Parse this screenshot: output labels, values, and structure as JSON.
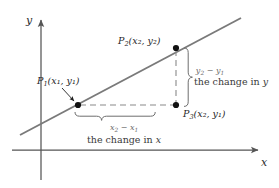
{
  "figure": {
    "type": "slope-diagram",
    "background_color": "#ffffff"
  },
  "axes": {
    "x_label": "x",
    "y_label": "y",
    "axis_color": "#555555",
    "x_axis": {
      "x1": 12,
      "y1": 150,
      "x2": 262,
      "y2": 150
    },
    "y_axis": {
      "x1": 41,
      "y1": 180,
      "x2": 41,
      "y2": 16
    }
  },
  "line": {
    "name": "sloped-line",
    "color": "#7a7a7a",
    "x1": 20,
    "y1": 135,
    "x2": 241,
    "y2": 18
  },
  "points": [
    {
      "id": "P1",
      "name": "point-p1",
      "label_main": "P",
      "label_sub": "1",
      "label_coords": "(x₁, y₁)",
      "coord_x_sym": "x",
      "coord_x_sub": "1",
      "coord_y_sym": "y",
      "coord_y_sub": "1",
      "cx": 78,
      "cy": 105
    },
    {
      "id": "P2",
      "name": "point-p2",
      "label_main": "P",
      "label_sub": "2",
      "label_coords": "(x₂, y₂)",
      "coord_x_sym": "x",
      "coord_x_sub": "2",
      "coord_y_sym": "y",
      "coord_y_sub": "2",
      "cx": 176,
      "cy": 48
    },
    {
      "id": "P3",
      "name": "point-p3",
      "label_main": "P",
      "label_sub": "3",
      "label_coords": "(x₂, y₁)",
      "coord_x_sym": "x",
      "coord_x_sub": "2",
      "coord_y_sym": "y",
      "coord_y_sub": "1",
      "cx": 176,
      "cy": 105
    }
  ],
  "annotations": {
    "vertical": {
      "name": "change-in-y-annotation",
      "formula_lhs": "y",
      "formula_lhs_sub": "2",
      "formula_op": " − ",
      "formula_rhs": "y",
      "formula_rhs_sub": "1",
      "caption_prefix": "the change in ",
      "caption_var": "y",
      "brace_top": 48,
      "brace_bottom": 108
    },
    "horizontal": {
      "name": "change-in-x-annotation",
      "formula_lhs": "x",
      "formula_lhs_sub": "2",
      "formula_op": " − ",
      "formula_rhs": "x",
      "formula_rhs_sub": "1",
      "caption_prefix": "the change in ",
      "caption_var": "x",
      "brace_left": 75,
      "brace_right": 178
    }
  },
  "guides": {
    "horizontal_dashed": {
      "name": "run-dashed-guide",
      "x1": 80,
      "y1": 105,
      "x2": 174,
      "y2": 105
    },
    "vertical_dashed": {
      "name": "rise-dashed-guide",
      "x1": 176,
      "y1": 50,
      "x2": 176,
      "y2": 103
    },
    "dash_color": "#8a8a8a"
  },
  "leader": {
    "name": "p1-leader-arrow",
    "x1": 62,
    "y1": 88,
    "x2": 75,
    "y2": 102
  }
}
